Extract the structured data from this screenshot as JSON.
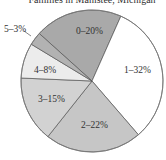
{
  "chart_data": {
    "type": "pie",
    "title": "Families in Manistee, Michigan",
    "categories": [
      "0",
      "1",
      "2",
      "3",
      "4",
      "5"
    ],
    "values": [
      20,
      32,
      22,
      15,
      8,
      3
    ],
    "labels": [
      "0–20%",
      "1–32%",
      "2–22%",
      "3–15%",
      "4–8%",
      "5–3%"
    ],
    "colors": [
      "#a9a9a9",
      "#ffffff",
      "#c6c6c6",
      "#d2d2d2",
      "#ececec",
      "#b2b2b2"
    ],
    "start_angle_deg": -48,
    "direction": "clockwise",
    "legend": "none",
    "units": "%"
  },
  "chart": {
    "title": "Families in Manistee, Michigan",
    "slice_labels": {
      "s0": "0–20%",
      "s1": "1–32%",
      "s2": "2–22%",
      "s3": "3–15%",
      "s4": "4–8%",
      "s5": "5–3%"
    }
  }
}
